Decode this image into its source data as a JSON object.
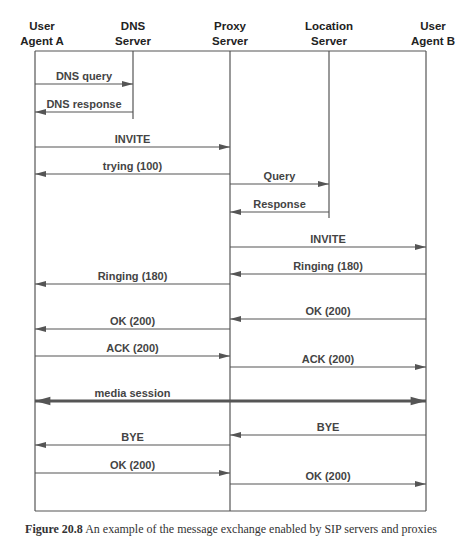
{
  "participants": [
    {
      "id": "ua_a",
      "line1": "User",
      "line2": "Agent A",
      "x": 35
    },
    {
      "id": "dns",
      "line1": "DNS",
      "line2": "Server",
      "x": 133
    },
    {
      "id": "proxy",
      "line1": "Proxy",
      "line2": "Server",
      "x": 230
    },
    {
      "id": "location",
      "line1": "Location",
      "line2": "Server",
      "x": 329
    },
    {
      "id": "ua_b",
      "line1": "User",
      "line2": "Agent B",
      "x": 426
    }
  ],
  "messages": [
    {
      "label": "DNS query",
      "from": "ua_a",
      "to": "dns",
      "y": 84
    },
    {
      "label": "DNS response",
      "from": "dns",
      "to": "ua_a",
      "y": 112
    },
    {
      "label": "INVITE",
      "from": "ua_a",
      "to": "proxy",
      "y": 147
    },
    {
      "label": "trying (100)",
      "from": "proxy",
      "to": "ua_a",
      "y": 174
    },
    {
      "label": "Query",
      "from": "proxy",
      "to": "location",
      "y": 184
    },
    {
      "label": "Response",
      "from": "location",
      "to": "proxy",
      "y": 212
    },
    {
      "label": "INVITE",
      "from": "proxy",
      "to": "ua_b",
      "y": 247
    },
    {
      "label": "Ringing (180)",
      "from": "ua_b",
      "to": "proxy",
      "y": 274
    },
    {
      "label": "Ringing (180)",
      "from": "proxy",
      "to": "ua_a",
      "y": 284
    },
    {
      "label": "OK (200)",
      "from": "ua_b",
      "to": "proxy",
      "y": 319
    },
    {
      "label": "OK (200)",
      "from": "proxy",
      "to": "ua_a",
      "y": 329
    },
    {
      "label": "ACK (200)",
      "from": "ua_a",
      "to": "proxy",
      "y": 356
    },
    {
      "label": "ACK (200)",
      "from": "proxy",
      "to": "ua_b",
      "y": 367
    },
    {
      "label": "media session",
      "from": "ua_a",
      "to": "ua_b",
      "y": 401,
      "bidirectional": true
    },
    {
      "label": "BYE",
      "from": "ua_b",
      "to": "proxy",
      "y": 435
    },
    {
      "label": "BYE",
      "from": "proxy",
      "to": "ua_a",
      "y": 445
    },
    {
      "label": "OK (200)",
      "from": "ua_a",
      "to": "proxy",
      "y": 473
    },
    {
      "label": "OK (200)",
      "from": "proxy",
      "to": "ua_b",
      "y": 484
    }
  ],
  "lifelines": {
    "top_y": 51,
    "bottom_y": 511,
    "dns_end_y": 119,
    "location_end_y": 218
  },
  "caption": {
    "prefix": "Figure 20.8",
    "text": "An example of the message exchange enabled by SIP servers and proxies"
  },
  "colors": {
    "line": "#555555",
    "label": "#444444",
    "header": "#222222"
  }
}
